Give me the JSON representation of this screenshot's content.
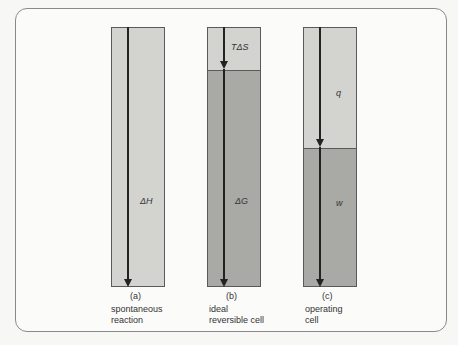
{
  "diagram": {
    "bars": [
      {
        "id": "a",
        "caption": "(a)",
        "label_line1": "spontaneous",
        "label_line2": "reaction",
        "top_symbol": "",
        "bottom_symbol": "ΔH",
        "light_color": "#d3d3d0",
        "dark_color": "#a9a9a6"
      },
      {
        "id": "b",
        "caption": "(b)",
        "label_line1": "ideal",
        "label_line2": "reversible cell",
        "top_symbol": "TΔS",
        "bottom_symbol": "ΔG",
        "light_color": "#d3d3d0",
        "dark_color": "#a9a9a6"
      },
      {
        "id": "c",
        "caption": "(c)",
        "label_line1": "operating",
        "label_line2": "cell",
        "top_symbol": "q",
        "bottom_symbol": "w",
        "light_color": "#d3d3d0",
        "dark_color": "#a9a9a6"
      }
    ]
  }
}
